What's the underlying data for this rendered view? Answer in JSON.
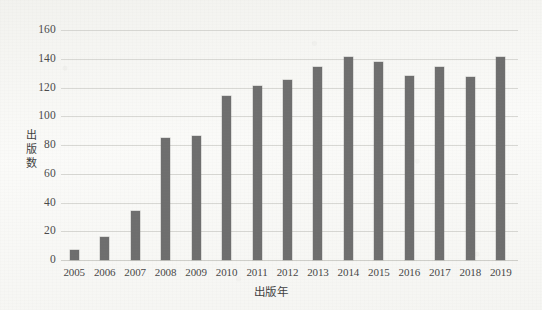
{
  "figure": {
    "background_color": "#fafaf8",
    "bar_color": "#6e6e6e",
    "gridline_color": "#d8d8d4"
  },
  "chart_data": {
    "type": "bar",
    "title": "",
    "xlabel": "出版年",
    "ylabel": "出版数",
    "categories": [
      "2005",
      "2006",
      "2007",
      "2008",
      "2009",
      "2010",
      "2011",
      "2012",
      "2013",
      "2014",
      "2015",
      "2016",
      "2017",
      "2018",
      "2019"
    ],
    "values": [
      7,
      16,
      34,
      85,
      86,
      114,
      121,
      125,
      134,
      141,
      138,
      128,
      134,
      127,
      141
    ],
    "ylim": [
      0,
      160
    ],
    "yticks": [
      0,
      20,
      40,
      60,
      80,
      100,
      120,
      140,
      160
    ],
    "ytick_labels": [
      "0",
      "20",
      "40",
      "60",
      "80",
      "100",
      "120",
      "140",
      "160"
    ],
    "grid": "horizontal",
    "legend": "none"
  }
}
